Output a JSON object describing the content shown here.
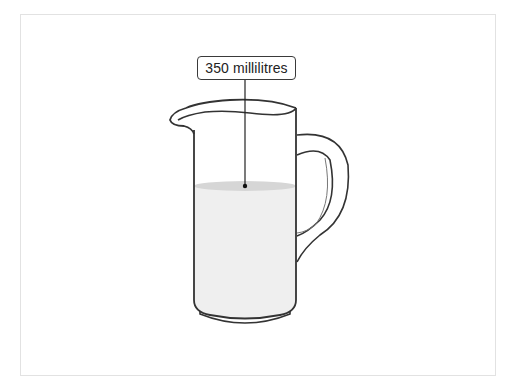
{
  "diagram": {
    "type": "measuring-jug",
    "label": "350 millilitres",
    "colors": {
      "outline": "#333333",
      "liquid": "#efefef",
      "liquid_surface": "#d8d8d8",
      "frame": "#e2e2e2",
      "background": "#ffffff"
    }
  }
}
